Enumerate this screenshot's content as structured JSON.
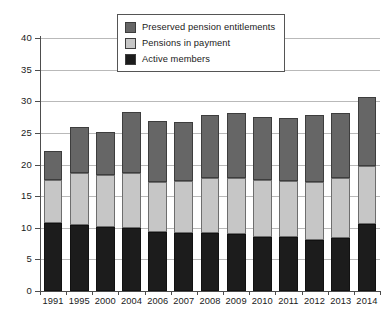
{
  "chart_data": {
    "type": "bar",
    "stacked": true,
    "title": "",
    "subtitle": "",
    "xlabel": "",
    "ylabel": "",
    "ylim": [
      0,
      40
    ],
    "yticks": [
      0,
      5,
      10,
      15,
      20,
      25,
      30,
      35,
      40
    ],
    "grid": true,
    "legend_position": "top-center",
    "categories": [
      "1991",
      "1995",
      "2000",
      "2004",
      "2006",
      "2007",
      "2008",
      "2009",
      "2010",
      "2011",
      "2012",
      "2013",
      "2014"
    ],
    "series": [
      {
        "name": "Active members",
        "color": "#1c1c1c",
        "values": [
          10.8,
          10.4,
          10.2,
          9.9,
          9.4,
          9.1,
          9.2,
          9.0,
          8.6,
          8.6,
          8.1,
          8.4,
          10.6
        ]
      },
      {
        "name": "Pensions in payment",
        "color": "#c6c6c6",
        "values": [
          6.8,
          8.3,
          8.1,
          8.8,
          7.9,
          8.3,
          8.6,
          8.9,
          8.9,
          8.8,
          9.1,
          9.4,
          9.2
        ]
      },
      {
        "name": "Preserved pension entitlements",
        "color": "#666666",
        "values": [
          4.6,
          7.2,
          6.9,
          9.6,
          9.6,
          9.4,
          10.1,
          10.2,
          10.0,
          10.0,
          10.6,
          10.4,
          10.9
        ]
      }
    ],
    "totals": [
      22.2,
      25.9,
      25.2,
      28.3,
      26.9,
      26.8,
      27.9,
      28.1,
      27.5,
      27.4,
      27.8,
      28.2,
      30.7
    ]
  },
  "legend": {
    "items": [
      {
        "label": "Preserved pension entitlements",
        "color": "#666666",
        "swatch_name": "legend-swatch-preserved"
      },
      {
        "label": "Pensions in payment",
        "color": "#c6c6c6",
        "swatch_name": "legend-swatch-payment"
      },
      {
        "label": "Active members",
        "color": "#1c1c1c",
        "swatch_name": "legend-swatch-active"
      }
    ]
  },
  "colors": {
    "active_members": "#1c1c1c",
    "pensions_in_payment": "#c6c6c6",
    "preserved_entitlements": "#666666",
    "gridline": "#b9b9b9",
    "axis": "#4d4d4d",
    "text": "#1a1a1a",
    "background": "#ffffff"
  }
}
